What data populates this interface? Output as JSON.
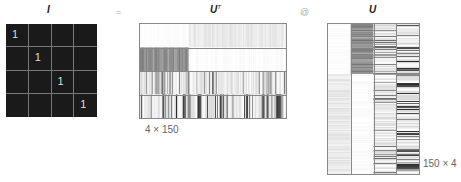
{
  "titles": {
    "identity": "I",
    "ut_base": "U",
    "ut_sup": "T",
    "u": "U"
  },
  "operators": {
    "equals": "=",
    "matmul": "@"
  },
  "dimensions": {
    "ut": "4 × 150",
    "u": "150 × 4"
  },
  "identity_matrix": {
    "size": 4,
    "values": [
      [
        "1",
        "",
        "",
        ""
      ],
      [
        "",
        "1",
        "",
        ""
      ],
      [
        "",
        "",
        "1",
        ""
      ],
      [
        "",
        "",
        "",
        "1"
      ]
    ],
    "background": "#1a1a1a",
    "grid_color": "#777777"
  },
  "eigen_matrix": {
    "n": 150,
    "k": 4,
    "vectors": [
      {
        "index": 0,
        "pattern": "light-band",
        "active_range": [
          50,
          149
        ],
        "intensity": 0.12
      },
      {
        "index": 1,
        "pattern": "dark-block",
        "active_range": [
          0,
          49
        ],
        "intensity": 0.55
      },
      {
        "index": 2,
        "pattern": "scattered",
        "active_range": [
          50,
          149
        ],
        "intensity": 0.6
      },
      {
        "index": 3,
        "pattern": "scattered",
        "active_range": [
          50,
          149
        ],
        "intensity": 0.85
      }
    ]
  }
}
